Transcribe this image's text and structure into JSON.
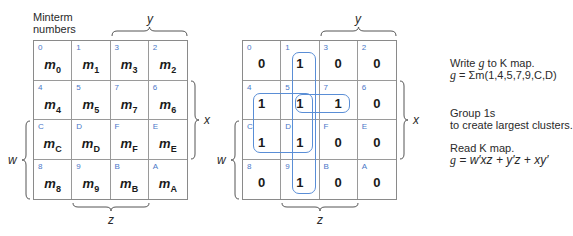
{
  "left_map": {
    "caption_line1": "Minterm",
    "caption_line2": "numbers",
    "var_y": "y",
    "var_x": "x",
    "var_w": "w",
    "var_z": "z",
    "cells": [
      {
        "index": "0",
        "term": "m",
        "sub": "0"
      },
      {
        "index": "1",
        "term": "m",
        "sub": "1"
      },
      {
        "index": "3",
        "term": "m",
        "sub": "3"
      },
      {
        "index": "2",
        "term": "m",
        "sub": "2"
      },
      {
        "index": "4",
        "term": "m",
        "sub": "4"
      },
      {
        "index": "5",
        "term": "m",
        "sub": "5"
      },
      {
        "index": "7",
        "term": "m",
        "sub": "7"
      },
      {
        "index": "6",
        "term": "m",
        "sub": "6"
      },
      {
        "index": "C",
        "term": "m",
        "sub": "C"
      },
      {
        "index": "D",
        "term": "m",
        "sub": "D"
      },
      {
        "index": "F",
        "term": "m",
        "sub": "F"
      },
      {
        "index": "E",
        "term": "m",
        "sub": "E"
      },
      {
        "index": "8",
        "term": "m",
        "sub": "8"
      },
      {
        "index": "9",
        "term": "m",
        "sub": "9"
      },
      {
        "index": "B",
        "term": "m",
        "sub": "B"
      },
      {
        "index": "A",
        "term": "m",
        "sub": "A"
      }
    ]
  },
  "right_map": {
    "var_y": "y",
    "var_x": "x",
    "var_w": "w",
    "var_z": "z",
    "cells": [
      {
        "index": "0",
        "value": "0"
      },
      {
        "index": "1",
        "value": "1"
      },
      {
        "index": "3",
        "value": "0"
      },
      {
        "index": "2",
        "value": "0"
      },
      {
        "index": "4",
        "value": "1"
      },
      {
        "index": "5",
        "value": "1"
      },
      {
        "index": "7",
        "value": "1"
      },
      {
        "index": "6",
        "value": "0"
      },
      {
        "index": "C",
        "value": "1"
      },
      {
        "index": "D",
        "value": "1"
      },
      {
        "index": "F",
        "value": "0"
      },
      {
        "index": "E",
        "value": "0"
      },
      {
        "index": "8",
        "value": "0"
      },
      {
        "index": "9",
        "value": "1"
      },
      {
        "index": "B",
        "value": "0"
      },
      {
        "index": "A",
        "value": "0"
      }
    ],
    "groups": [
      {
        "name": "column-1-group",
        "cells": [
          "1",
          "5",
          "D",
          "9"
        ],
        "term": "y'z"
      },
      {
        "name": "square-group",
        "cells": [
          "4",
          "5",
          "C",
          "D"
        ],
        "term": "xy'"
      },
      {
        "name": "row-pair-group",
        "cells": [
          "5",
          "7"
        ],
        "term": "w'xz"
      }
    ],
    "loop_color": "#5a8ed6"
  },
  "notes": {
    "step1_line1_pre": "Write ",
    "step1_line1_var": "g",
    "step1_line1_post": " to K map.",
    "step1_line2_var": "g",
    "step1_line2_post": " = Σm(1,4,5,7,9,C,D)",
    "step2_line1": "Group 1s",
    "step2_line2": "to create largest clusters.",
    "step3_line1": "Read K map.",
    "step3_line2_var": "g",
    "step3_line2_post": " = w′xz + y′z + xy′"
  },
  "colors": {
    "index_blue": "#4a78c8",
    "grid_line": "#9a9a9a"
  }
}
